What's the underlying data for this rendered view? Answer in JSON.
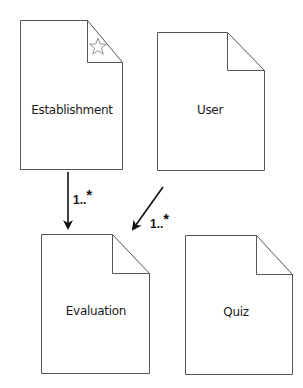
{
  "diagram": {
    "nodes": [
      {
        "id": "establishment",
        "label": "Establishment",
        "starred": true
      },
      {
        "id": "user",
        "label": "User",
        "starred": false
      },
      {
        "id": "evaluation",
        "label": "Evaluation",
        "starred": false
      },
      {
        "id": "quiz",
        "label": "Quiz",
        "starred": false
      }
    ],
    "edges": [
      {
        "from": "establishment",
        "to": "evaluation",
        "multiplicity": "1..",
        "multiplicity_star": "*"
      },
      {
        "from": "user",
        "to": "evaluation",
        "multiplicity": "1..",
        "multiplicity_star": "*"
      }
    ],
    "colors": {
      "stroke": "#555555",
      "arrow": "#111111",
      "background": "#ffffff"
    }
  }
}
